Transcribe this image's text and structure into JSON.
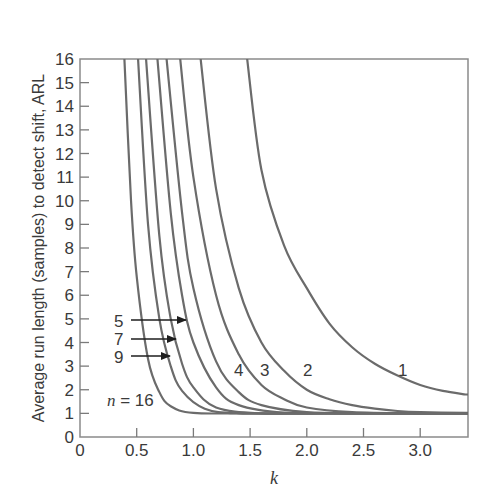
{
  "chart_data": {
    "type": "line",
    "title": "",
    "xlabel": "k",
    "ylabel": "Average run length (samples) to detect shift, ARL",
    "xlim": [
      0,
      3.4
    ],
    "ylim": [
      0,
      16
    ],
    "x_ticks": [
      "0",
      "0.5",
      "1.0",
      "1.5",
      "2.0",
      "2.5",
      "3.0"
    ],
    "x_tick_values": [
      0,
      0.5,
      1.0,
      1.5,
      2.0,
      2.5,
      3.0
    ],
    "y_ticks": [
      "0",
      "1",
      "2",
      "3",
      "4",
      "5",
      "6",
      "7",
      "8",
      "9",
      "10",
      "11",
      "12",
      "13",
      "14",
      "15",
      "16"
    ],
    "grid": false,
    "legend": "inline curve labels",
    "series": [
      {
        "name": "n = 1",
        "label": "1",
        "k": [
          1.47,
          1.6,
          1.8,
          2.0,
          2.2,
          2.4,
          2.6,
          2.8,
          3.0,
          3.2,
          3.4
        ],
        "arl": [
          16,
          11.3,
          8.1,
          6.3,
          4.8,
          3.8,
          3.1,
          2.6,
          2.2,
          1.95,
          1.8
        ]
      },
      {
        "name": "n = 2",
        "label": "2",
        "k": [
          1.06,
          1.2,
          1.4,
          1.6,
          1.8,
          2.0,
          2.2,
          2.4,
          2.6,
          2.8,
          3.0,
          3.4
        ],
        "arl": [
          16,
          10.5,
          6.3,
          4.0,
          2.8,
          2.0,
          1.6,
          1.35,
          1.2,
          1.1,
          1.05,
          1.02
        ]
      },
      {
        "name": "n = 3",
        "label": "3",
        "k": [
          0.88,
          1.0,
          1.2,
          1.4,
          1.6,
          1.8,
          2.0,
          2.4,
          3.0,
          3.4
        ],
        "arl": [
          16,
          11.0,
          6.0,
          3.5,
          2.2,
          1.6,
          1.25,
          1.05,
          1.0,
          1.0
        ]
      },
      {
        "name": "n = 4",
        "label": "4",
        "k": [
          0.76,
          0.9,
          1.0,
          1.2,
          1.4,
          1.6,
          2.0,
          2.5,
          3.4
        ],
        "arl": [
          16,
          9.5,
          6.3,
          3.2,
          1.9,
          1.35,
          1.05,
          1.0,
          1.0
        ]
      },
      {
        "name": "n = 5",
        "label": "5",
        "k": [
          0.68,
          0.8,
          0.9,
          1.0,
          1.2,
          1.4,
          1.8,
          2.4,
          3.4
        ],
        "arl": [
          16,
          9.5,
          6.0,
          4.0,
          2.1,
          1.35,
          1.03,
          1.0,
          1.0
        ]
      },
      {
        "name": "n = 7",
        "label": "7",
        "k": [
          0.58,
          0.7,
          0.8,
          0.9,
          1.0,
          1.2,
          1.6,
          2.2,
          3.4
        ],
        "arl": [
          16,
          8.5,
          5.0,
          3.1,
          2.1,
          1.25,
          1.0,
          1.0,
          1.0
        ]
      },
      {
        "name": "n = 9",
        "label": "9",
        "k": [
          0.51,
          0.6,
          0.7,
          0.8,
          0.9,
          1.1,
          1.4,
          2.0,
          3.4
        ],
        "arl": [
          16,
          9.0,
          5.0,
          3.0,
          1.95,
          1.2,
          1.0,
          1.0,
          1.0
        ]
      },
      {
        "name": "n = 16",
        "label": "n = 16",
        "k": [
          0.39,
          0.45,
          0.5,
          0.6,
          0.7,
          0.8,
          1.0,
          1.5,
          3.4
        ],
        "arl": [
          16,
          10.0,
          6.8,
          3.3,
          1.9,
          1.3,
          1.02,
          1.0,
          1.0
        ]
      }
    ],
    "annotations": [
      {
        "text": "5",
        "arrow_to_series": "n = 5"
      },
      {
        "text": "7",
        "arrow_to_series": "n = 7"
      },
      {
        "text": "9",
        "arrow_to_series": "n = 9"
      },
      {
        "text": "4",
        "series": "n = 4"
      },
      {
        "text": "3",
        "series": "n = 3"
      },
      {
        "text": "2",
        "series": "n = 2"
      },
      {
        "text": "1",
        "series": "n = 1"
      },
      {
        "text": "n = 16",
        "series": "n = 16"
      }
    ]
  },
  "labels": {
    "ylabel": "Average run length (samples) to detect shift, ARL",
    "xlabel": "k",
    "n16_prefix": "n",
    "n16_suffix": " = 16",
    "c1": "1",
    "c2": "2",
    "c3": "3",
    "c4": "4",
    "a5": "5",
    "a7": "7",
    "a9": "9"
  },
  "style": {
    "line_color": "#6b6b6b",
    "axis_color": "#7a7a7a",
    "text_color": "#3a3a3a"
  }
}
